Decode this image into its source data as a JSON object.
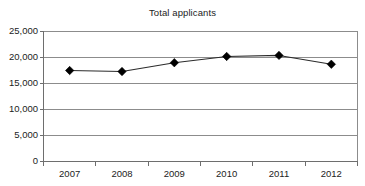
{
  "chart_data": {
    "type": "line",
    "title": "Total applicants",
    "xlabel": "",
    "ylabel": "",
    "categories": [
      "2007",
      "2008",
      "2009",
      "2010",
      "2011",
      "2012"
    ],
    "values": [
      17500,
      17300,
      19000,
      20200,
      20400,
      18700
    ],
    "series": [
      {
        "name": "Total applicants",
        "values": [
          17500,
          17300,
          19000,
          20200,
          20400,
          18700
        ]
      }
    ],
    "ylim": [
      0,
      25000
    ],
    "yticks": [
      0,
      5000,
      10000,
      15000,
      20000,
      25000
    ],
    "ytick_labels": [
      "0",
      "5,000",
      "10,000",
      "15,000",
      "20,000",
      "25,000"
    ],
    "xtick_labels": [
      "2007",
      "2008",
      "2009",
      "2010",
      "2011",
      "2012"
    ],
    "grid": true,
    "grid_axis": "y",
    "legend": false,
    "legend_position": "none",
    "marker": "diamond",
    "colors": {
      "line": "#2b2b2b",
      "marker": "#000000",
      "grid": "#8c8c8c",
      "axis": "#6e6e6e",
      "text": "#1c1c1c",
      "background": "#ffffff"
    }
  }
}
